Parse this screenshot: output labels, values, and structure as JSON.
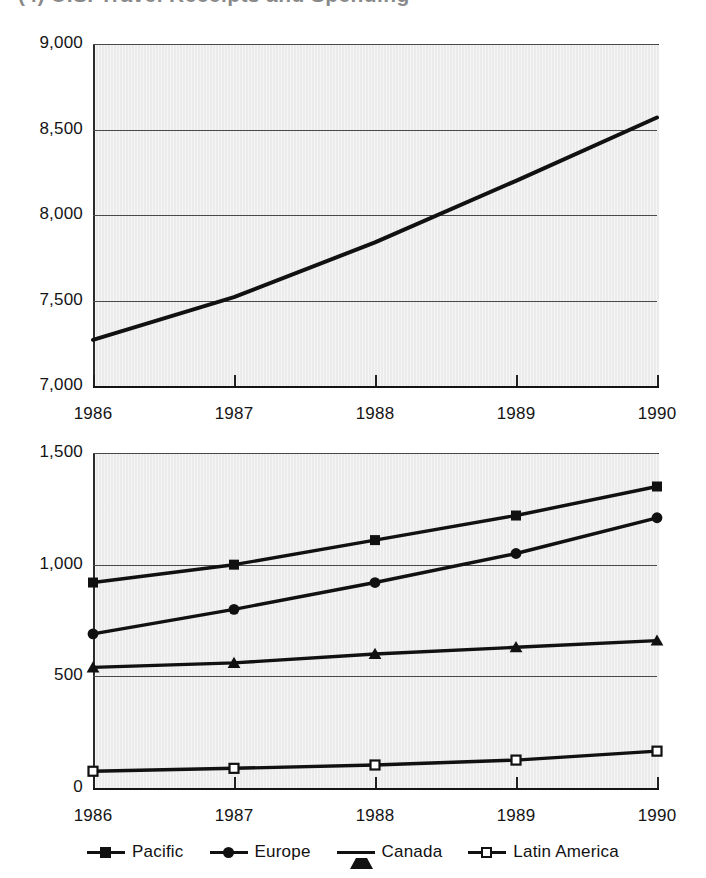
{
  "page": {
    "cutoff_title": "(4)   U.S. Travel Receipts and Spending"
  },
  "legend": {
    "items": [
      {
        "label": "Pacific",
        "marker": "filled-square"
      },
      {
        "label": "Europe",
        "marker": "filled-circle"
      },
      {
        "label": "Canada",
        "marker": "filled-triangle"
      },
      {
        "label": "Latin America",
        "marker": "open-square"
      }
    ]
  },
  "chart_data": [
    {
      "id": "top",
      "type": "line",
      "title": "",
      "xlabel": "",
      "ylabel": "",
      "categories": [
        "1986",
        "1987",
        "1988",
        "1989",
        "1990"
      ],
      "x": [
        1986,
        1987,
        1988,
        1989,
        1990
      ],
      "xlim": [
        1986,
        1990
      ],
      "ylim": [
        7000,
        9000
      ],
      "yticks": [
        7000,
        7500,
        8000,
        8500,
        9000
      ],
      "yticklabels": [
        "7,000",
        "7,500",
        "8,000",
        "8,500",
        "9,000"
      ],
      "grid": true,
      "legend": "none",
      "series": [
        {
          "name": "Total",
          "marker": "none",
          "values": [
            7270,
            7520,
            7840,
            8200,
            8570
          ]
        }
      ]
    },
    {
      "id": "bottom",
      "type": "line",
      "title": "",
      "xlabel": "",
      "ylabel": "",
      "categories": [
        "1986",
        "1987",
        "1988",
        "1989",
        "1990"
      ],
      "x": [
        1986,
        1987,
        1988,
        1989,
        1990
      ],
      "xlim": [
        1986,
        1990
      ],
      "ylim": [
        0,
        1500
      ],
      "yticks": [
        0,
        500,
        1000,
        1500
      ],
      "yticklabels": [
        "0",
        "500",
        "1,000",
        "1,500"
      ],
      "grid": true,
      "legend": "bottom-center",
      "series": [
        {
          "name": "Pacific",
          "marker": "filled-square",
          "values": [
            920,
            1000,
            1110,
            1220,
            1350
          ]
        },
        {
          "name": "Europe",
          "marker": "filled-circle",
          "values": [
            690,
            800,
            920,
            1050,
            1210
          ]
        },
        {
          "name": "Canada",
          "marker": "filled-triangle",
          "values": [
            540,
            560,
            600,
            630,
            660
          ]
        },
        {
          "name": "Latin America",
          "marker": "open-square",
          "values": [
            75,
            88,
            103,
            125,
            165
          ]
        }
      ]
    }
  ]
}
